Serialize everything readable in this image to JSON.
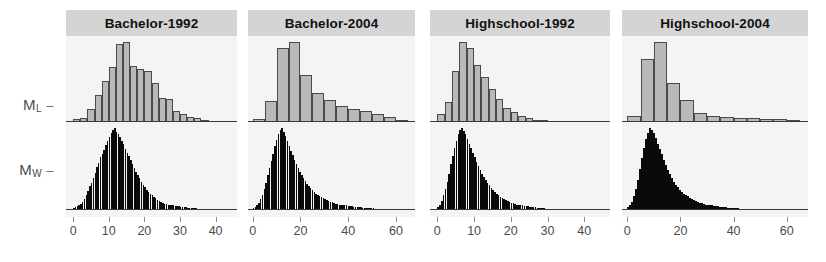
{
  "figure": {
    "type": "multi-panel-histogram",
    "panel_count": 4,
    "background_color": "#f4f4f4",
    "strip_color": "#d4d4d4",
    "grey_series_color": "#b9b9b9",
    "black_series_color": "#0a0a0a"
  },
  "y_axis": {
    "labels": [
      {
        "base": "M",
        "sub": "L",
        "dash": "–"
      },
      {
        "base": "M",
        "sub": "W",
        "dash": "–"
      }
    ]
  },
  "chart_data": [
    {
      "type": "bar",
      "title": "Bachelor-1992",
      "xlabel": "",
      "ylabel": "",
      "xlim": [
        -2,
        46
      ],
      "ticks": [
        0,
        10,
        20,
        30,
        40
      ],
      "grid": false,
      "legend": "none",
      "series": [
        {
          "name": "M_L",
          "color": "#b9b9b9",
          "bin_width": 2,
          "bin_starts": [
            0,
            2,
            4,
            6,
            8,
            10,
            12,
            14,
            16,
            18,
            20,
            22,
            24,
            26,
            28,
            30,
            32,
            34,
            36,
            38,
            40,
            42
          ],
          "values": [
            3,
            4,
            12,
            26,
            39,
            52,
            74,
            76,
            53,
            50,
            48,
            37,
            23,
            22,
            10,
            8,
            5,
            4,
            2,
            1,
            1,
            1
          ]
        },
        {
          "name": "M_W",
          "color": "#0a0a0a",
          "bin_width": 0.5,
          "bin_starts": [
            0,
            0.5,
            1,
            1.5,
            2,
            2.5,
            3,
            3.5,
            4,
            4.5,
            5,
            5.5,
            6,
            6.5,
            7,
            7.5,
            8,
            8.5,
            9,
            9.5,
            10,
            10.5,
            11,
            11.5,
            12,
            12.5,
            13,
            13.5,
            14,
            14.5,
            15,
            15.5,
            16,
            16.5,
            17,
            17.5,
            18,
            18.5,
            19,
            19.5,
            20,
            20.5,
            21,
            21.5,
            22,
            22.5,
            23,
            23.5,
            24,
            24.5,
            25,
            25.5,
            26,
            26.5,
            27,
            27.5,
            28,
            28.5,
            29,
            29.5,
            30,
            30.5,
            31,
            31.5,
            32,
            32.5,
            33,
            33.5,
            34,
            34.5,
            35,
            35.5,
            36,
            36.5
          ],
          "values": [
            2,
            3,
            4,
            5,
            7,
            9,
            12,
            16,
            21,
            26,
            30,
            35,
            41,
            47,
            52,
            58,
            62,
            66,
            71,
            76,
            80,
            84,
            88,
            90,
            86,
            83,
            80,
            76,
            72,
            67,
            63,
            59,
            55,
            50,
            46,
            42,
            38,
            35,
            31,
            28,
            25,
            22,
            20,
            18,
            16,
            14,
            13,
            11,
            10,
            9,
            8,
            7,
            7,
            6,
            6,
            5,
            5,
            4,
            4,
            4,
            3,
            3,
            3,
            3,
            2,
            2,
            2,
            2,
            2,
            2,
            1,
            1,
            1,
            1
          ]
        }
      ]
    },
    {
      "type": "bar",
      "title": "Bachelor-2004",
      "xlabel": "",
      "ylabel": "",
      "xlim": [
        -2,
        68
      ],
      "ticks": [
        0,
        20,
        40,
        60
      ],
      "grid": false,
      "legend": "none",
      "series": [
        {
          "name": "M_L",
          "color": "#b9b9b9",
          "bin_width": 5,
          "bin_starts": [
            0,
            5,
            10,
            15,
            20,
            25,
            30,
            35,
            40,
            45,
            50,
            55,
            60
          ],
          "values": [
            3,
            22,
            76,
            82,
            48,
            30,
            23,
            16,
            13,
            11,
            8,
            5,
            2
          ]
        },
        {
          "name": "M_W",
          "color": "#0a0a0a",
          "bin_width": 0.75,
          "bin_starts": [
            0,
            0.75,
            1.5,
            2.25,
            3,
            3.75,
            4.5,
            5.25,
            6,
            6.75,
            7.5,
            8.25,
            9,
            9.75,
            10.5,
            11.25,
            12,
            12.75,
            13.5,
            14.25,
            15,
            15.75,
            16.5,
            17.25,
            18,
            18.75,
            19.5,
            20.25,
            21,
            21.75,
            22.5,
            23.25,
            24,
            24.75,
            25.5,
            26.25,
            27,
            27.75,
            28.5,
            29.25,
            30,
            30.75,
            31.5,
            32.25,
            33,
            33.75,
            34.5,
            35.25,
            36,
            36.75,
            37.5,
            38.25,
            39,
            39.75,
            40.5,
            41.25,
            42,
            42.75,
            43.5,
            44.25,
            45,
            45.75,
            46.5,
            47.25,
            48,
            48.75,
            49.5,
            50.25,
            51,
            51.75,
            52.5,
            53.25
          ],
          "values": [
            2,
            3,
            5,
            8,
            12,
            17,
            23,
            30,
            38,
            46,
            54,
            62,
            70,
            77,
            83,
            88,
            90,
            86,
            81,
            76,
            70,
            65,
            60,
            55,
            50,
            46,
            42,
            38,
            35,
            32,
            29,
            26,
            24,
            22,
            20,
            18,
            17,
            15,
            14,
            13,
            12,
            11,
            10,
            9,
            9,
            8,
            7,
            7,
            6,
            6,
            5,
            5,
            5,
            4,
            4,
            4,
            3,
            3,
            3,
            3,
            3,
            2,
            2,
            2,
            2,
            2,
            2,
            2,
            1,
            1,
            1,
            1
          ]
        }
      ]
    },
    {
      "type": "bar",
      "title": "Highschool-1992",
      "xlabel": "",
      "ylabel": "",
      "xlim": [
        -2,
        47
      ],
      "ticks": [
        0,
        10,
        20,
        30,
        40
      ],
      "grid": false,
      "legend": "none",
      "series": [
        {
          "name": "M_L",
          "color": "#b9b9b9",
          "bin_width": 2,
          "bin_starts": [
            0,
            2,
            4,
            6,
            8,
            10,
            12,
            14,
            16,
            18,
            20,
            22,
            24,
            26,
            28,
            30,
            32,
            34,
            36,
            38,
            40,
            42,
            44
          ],
          "values": [
            8,
            20,
            50,
            78,
            72,
            56,
            44,
            32,
            22,
            14,
            10,
            6,
            4,
            2,
            2,
            1,
            1,
            1,
            1,
            1,
            1,
            1,
            1
          ]
        },
        {
          "name": "M_W",
          "color": "#0a0a0a",
          "bin_width": 0.5,
          "bin_starts": [
            0,
            0.5,
            1,
            1.5,
            2,
            2.5,
            3,
            3.5,
            4,
            4.5,
            5,
            5.5,
            6,
            6.5,
            7,
            7.5,
            8,
            8.5,
            9,
            9.5,
            10,
            10.5,
            11,
            11.5,
            12,
            12.5,
            13,
            13.5,
            14,
            14.5,
            15,
            15.5,
            16,
            16.5,
            17,
            17.5,
            18,
            18.5,
            19,
            19.5,
            20,
            20.5,
            21,
            21.5,
            22,
            22.5,
            23,
            23.5,
            24,
            24.5,
            25,
            25.5,
            26,
            26.5,
            27,
            27.5,
            28,
            28.5,
            29,
            29.5,
            30
          ],
          "values": [
            3,
            6,
            10,
            16,
            23,
            31,
            40,
            50,
            59,
            68,
            76,
            83,
            88,
            90,
            87,
            83,
            78,
            73,
            68,
            63,
            58,
            53,
            48,
            44,
            40,
            36,
            33,
            30,
            27,
            24,
            22,
            20,
            18,
            16,
            14,
            13,
            12,
            11,
            10,
            9,
            8,
            8,
            7,
            6,
            6,
            5,
            5,
            4,
            4,
            4,
            3,
            3,
            3,
            3,
            2,
            2,
            2,
            2,
            2,
            1,
            1
          ]
        }
      ]
    },
    {
      "type": "bar",
      "title": "Highschool-2004",
      "xlabel": "",
      "ylabel": "",
      "xlim": [
        -2,
        68
      ],
      "ticks": [
        0,
        20,
        40,
        60
      ],
      "grid": false,
      "legend": "none",
      "series": [
        {
          "name": "M_L",
          "color": "#b9b9b9",
          "bin_width": 5,
          "bin_starts": [
            0,
            5,
            10,
            15,
            20,
            25,
            30,
            35,
            40,
            45,
            50,
            55,
            60
          ],
          "values": [
            6,
            68,
            86,
            42,
            24,
            10,
            6,
            5,
            4,
            4,
            3,
            3,
            2
          ]
        },
        {
          "name": "M_W",
          "color": "#0a0a0a",
          "bin_width": 0.75,
          "bin_starts": [
            0,
            0.75,
            1.5,
            2.25,
            3,
            3.75,
            4.5,
            5.25,
            6,
            6.75,
            7.5,
            8.25,
            9,
            9.75,
            10.5,
            11.25,
            12,
            12.75,
            13.5,
            14.25,
            15,
            15.75,
            16.5,
            17.25,
            18,
            18.75,
            19.5,
            20.25,
            21,
            21.75,
            22.5,
            23.25,
            24,
            24.75,
            25.5,
            26.25,
            27,
            27.75,
            28.5,
            29.25,
            30,
            30.75,
            31.5,
            32.25,
            33,
            33.75,
            34.5,
            35.25,
            36,
            36.75,
            37.5,
            38.25,
            39,
            39.75,
            40.5,
            41.25,
            42,
            42.75,
            43.5,
            44.25,
            45,
            45.75,
            46.5
          ],
          "values": [
            3,
            5,
            9,
            15,
            23,
            33,
            45,
            57,
            68,
            78,
            85,
            90,
            88,
            84,
            79,
            73,
            67,
            61,
            55,
            49,
            44,
            39,
            35,
            31,
            28,
            25,
            22,
            20,
            18,
            16,
            15,
            13,
            12,
            11,
            10,
            9,
            8,
            8,
            7,
            6,
            6,
            5,
            5,
            4,
            4,
            4,
            3,
            3,
            3,
            3,
            2,
            2,
            2,
            2,
            2,
            2,
            1,
            1,
            1,
            1,
            1,
            1,
            1
          ]
        }
      ]
    }
  ],
  "layout": {
    "panel_geometry": [
      {
        "left": 66,
        "width": 171
      },
      {
        "left": 248,
        "width": 167
      },
      {
        "left": 430,
        "width": 180
      },
      {
        "left": 622,
        "width": 186
      }
    ]
  }
}
